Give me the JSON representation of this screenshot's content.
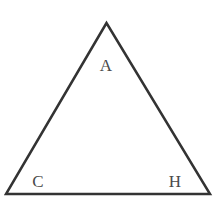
{
  "diagram": {
    "shape": "triangle",
    "stroke_color": "#333333",
    "fill_color": "#ffffff",
    "vertices": [
      {
        "id": "top",
        "x": 106.5,
        "y": 23
      },
      {
        "id": "bottom-left",
        "x": 6,
        "y": 194
      },
      {
        "id": "bottom-right",
        "x": 210,
        "y": 194
      }
    ],
    "labels": [
      {
        "id": "A",
        "text": "A",
        "x": 106,
        "y": 71
      },
      {
        "id": "C",
        "text": "C",
        "x": 38,
        "y": 187
      },
      {
        "id": "H",
        "text": "H",
        "x": 175,
        "y": 187
      }
    ]
  }
}
